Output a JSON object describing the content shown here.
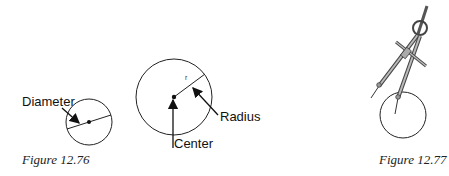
{
  "figures": [
    {
      "id": "fig-12-76",
      "caption": "Figure 12.76",
      "labels": {
        "diameter": "Diameter"
      }
    },
    {
      "id": "fig-12-76b",
      "labels": {
        "radius": "Radius",
        "center": "Center",
        "r": "r"
      }
    },
    {
      "id": "fig-12-77",
      "caption": "Figure 12.77"
    }
  ],
  "colors": {
    "stroke": "#222222",
    "compass_fill": "#b8b8b8"
  }
}
